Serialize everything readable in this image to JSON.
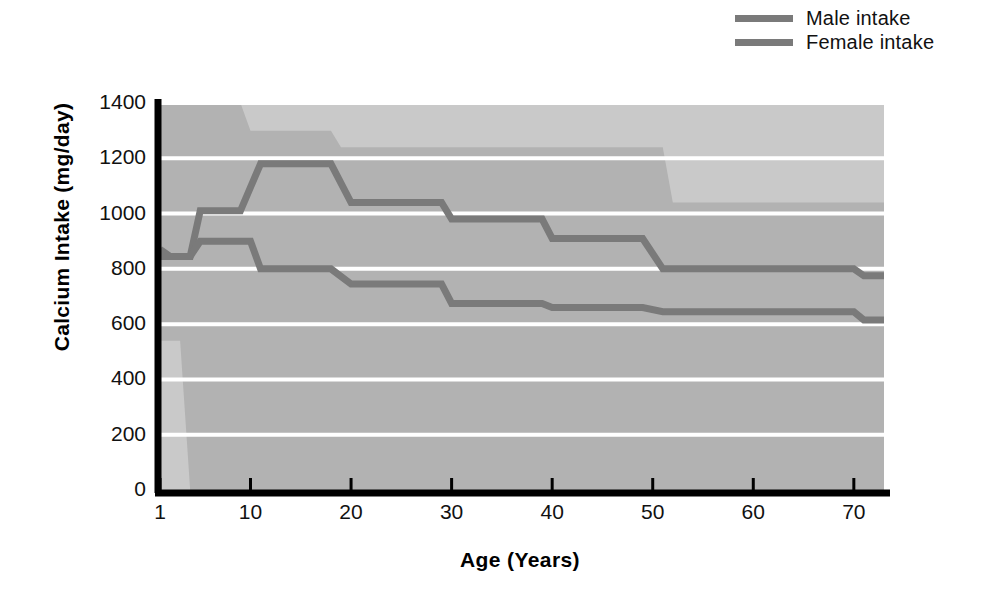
{
  "chart_data": {
    "type": "line",
    "title": "",
    "xlabel": "Age (Years)",
    "ylabel": "Calcium Intake (mg/day)",
    "xlim": [
      1,
      73
    ],
    "ylim": [
      0,
      1400
    ],
    "xticks": [
      1,
      10,
      20,
      30,
      40,
      50,
      60,
      70
    ],
    "yticks": [
      0,
      200,
      400,
      600,
      800,
      1000,
      1200,
      1400
    ],
    "grid": true,
    "grid_color": "#ffffff",
    "plot_background": "#c9c9c9",
    "band_color": "#b2b2b2",
    "line_color": "#7a7a7a",
    "legend_position": "top-right",
    "legend": [
      "Male intake",
      "Female intake"
    ],
    "series": [
      {
        "name": "Male intake",
        "style": "step",
        "points": [
          {
            "age": 1,
            "value": 870
          },
          {
            "age": 2,
            "value": 845
          },
          {
            "age": 4,
            "value": 845
          },
          {
            "age": 5,
            "value": 1010
          },
          {
            "age": 9,
            "value": 1010
          },
          {
            "age": 11,
            "value": 1180
          },
          {
            "age": 18,
            "value": 1180
          },
          {
            "age": 20,
            "value": 1040
          },
          {
            "age": 29,
            "value": 1040
          },
          {
            "age": 30,
            "value": 980
          },
          {
            "age": 39,
            "value": 980
          },
          {
            "age": 40,
            "value": 910
          },
          {
            "age": 49,
            "value": 910
          },
          {
            "age": 51,
            "value": 800
          },
          {
            "age": 70,
            "value": 800
          },
          {
            "age": 71,
            "value": 775
          },
          {
            "age": 73,
            "value": 775
          }
        ]
      },
      {
        "name": "Female intake",
        "style": "step",
        "points": [
          {
            "age": 1,
            "value": 845
          },
          {
            "age": 4,
            "value": 845
          },
          {
            "age": 5,
            "value": 900
          },
          {
            "age": 10,
            "value": 900
          },
          {
            "age": 11,
            "value": 800
          },
          {
            "age": 18,
            "value": 800
          },
          {
            "age": 20,
            "value": 745
          },
          {
            "age": 29,
            "value": 745
          },
          {
            "age": 30,
            "value": 675
          },
          {
            "age": 39,
            "value": 675
          },
          {
            "age": 40,
            "value": 660
          },
          {
            "age": 49,
            "value": 660
          },
          {
            "age": 51,
            "value": 645
          },
          {
            "age": 70,
            "value": 645
          },
          {
            "age": 71,
            "value": 615
          },
          {
            "age": 73,
            "value": 615
          }
        ]
      }
    ],
    "bands": [
      {
        "name": "recommended-range-band",
        "upper": [
          {
            "age": 1,
            "value": 1400
          },
          {
            "age": 9,
            "value": 1400
          },
          {
            "age": 10,
            "value": 1300
          },
          {
            "age": 18,
            "value": 1300
          },
          {
            "age": 19,
            "value": 1240
          },
          {
            "age": 51,
            "value": 1240
          },
          {
            "age": 52,
            "value": 1040
          },
          {
            "age": 73,
            "value": 1040
          }
        ],
        "lower": [
          {
            "age": 1,
            "value": 540
          },
          {
            "age": 3,
            "value": 540
          },
          {
            "age": 4,
            "value": 0
          },
          {
            "age": 73,
            "value": 0
          }
        ]
      }
    ]
  },
  "legend": {
    "items": [
      {
        "label": "Male intake",
        "color": "#7a7a7a"
      },
      {
        "label": "Female intake",
        "color": "#7a7a7a"
      }
    ]
  },
  "axes": {
    "y_title": "Calcium Intake (mg/day)",
    "x_title": "Age (Years)",
    "y_ticks": [
      "1400",
      "1200",
      "1000",
      "800",
      "600",
      "400",
      "200",
      "0"
    ],
    "x_ticks": [
      "1",
      "10",
      "20",
      "30",
      "40",
      "50",
      "60",
      "70"
    ]
  }
}
